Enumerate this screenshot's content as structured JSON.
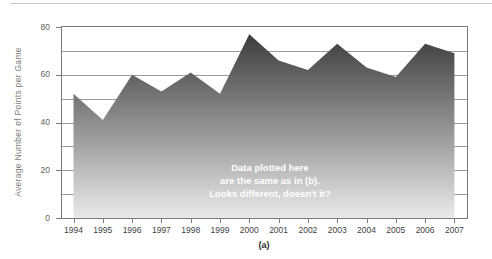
{
  "page": {
    "caption": "(a)"
  },
  "chart_data": {
    "type": "area",
    "title": "",
    "xlabel": "",
    "ylabel": "Average Number of Points per Game",
    "categories": [
      "1994",
      "1995",
      "1996",
      "1997",
      "1998",
      "1999",
      "2000",
      "2001",
      "2002",
      "2003",
      "2004",
      "2005",
      "2006",
      "2007"
    ],
    "values": [
      52,
      41,
      60,
      53,
      61,
      52,
      77,
      66,
      62,
      73,
      63,
      59,
      73,
      69
    ],
    "ylim": [
      0,
      80
    ],
    "yticks": [
      0,
      20,
      40,
      60,
      80
    ],
    "grid": true,
    "grid_interval": 10,
    "legend": "none",
    "annotation": {
      "line1": "Data plotted here",
      "line2": "are the same as in (b).",
      "line3": "Looks different, doesn't it?"
    },
    "colors": {
      "area_gradient_top": "#3c3c3c",
      "area_gradient_mid": "#9a9a9a",
      "area_gradient_bottom": "#eaeaea",
      "gridline": "#9a9a9a",
      "plot_border": "#7a7a7a",
      "annotation_text": "#ffffff"
    }
  }
}
